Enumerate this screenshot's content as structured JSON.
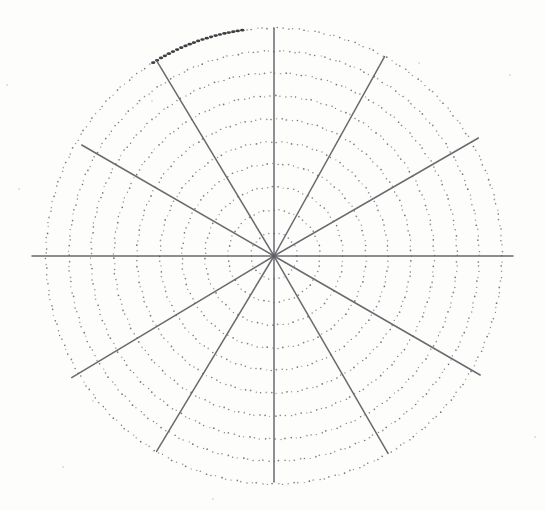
{
  "figure": {
    "name": "polar-coordinate-grid",
    "background_color": "#fdfdfc",
    "width": 546,
    "height": 510
  },
  "chart_data": {
    "type": "scatter",
    "subtype": "polar-grid-template",
    "title": "",
    "subtitle": "",
    "xlabel": "",
    "ylabel": "",
    "grid": true,
    "legend_position": "none",
    "series": [
      {
        "name": "none",
        "values": []
      }
    ],
    "categories": [],
    "x": [],
    "values": [],
    "annotations": [],
    "polar": {
      "center_x": 274,
      "center_y": 256,
      "outer_radius": 228,
      "ring_count": 10,
      "ring_radii": [
        23,
        46,
        69,
        92,
        114,
        137,
        160,
        183,
        205,
        228
      ],
      "ring_style": "dotted",
      "ring_color": "#6b6b72",
      "ring_dot_radius": 0.85,
      "ring_dot_gap_px": 5.2,
      "emphasized_arc": {
        "radius": 228,
        "start_deg": 98,
        "end_deg": 122,
        "color": "#2e2e33",
        "dot_radius": 1.6
      },
      "spoke_count": 12,
      "spoke_color": "#5f5f66",
      "spoke_width": 1.5,
      "spokes": [
        {
          "label": "90",
          "angle_deg": 90,
          "length": 228
        },
        {
          "label": "120",
          "angle_deg": 121,
          "length": 228
        },
        {
          "label": "150",
          "angle_deg": 150,
          "length": 222
        },
        {
          "label": "180",
          "angle_deg": 180,
          "length": 242
        },
        {
          "label": "210",
          "angle_deg": 211,
          "length": 236
        },
        {
          "label": "240",
          "angle_deg": 239,
          "length": 228
        },
        {
          "label": "270",
          "angle_deg": 270,
          "length": 226
        },
        {
          "label": "300",
          "angle_deg": 300,
          "length": 228
        },
        {
          "label": "330",
          "angle_deg": 330,
          "length": 238
        },
        {
          "label": "0",
          "angle_deg": 0,
          "length": 239
        },
        {
          "label": "30",
          "angle_deg": 30,
          "length": 236
        },
        {
          "label": "60",
          "angle_deg": 61,
          "length": 228
        }
      ]
    }
  },
  "scan_artifacts": {
    "specks": [
      {
        "x": 18,
        "y": 188,
        "size": 2
      },
      {
        "x": 62,
        "y": 466,
        "size": 2
      },
      {
        "x": 418,
        "y": 62,
        "size": 2
      },
      {
        "x": 509,
        "y": 74,
        "size": 2
      },
      {
        "x": 151,
        "y": 100,
        "size": 2
      },
      {
        "x": 431,
        "y": 286,
        "size": 2
      },
      {
        "x": 92,
        "y": 400,
        "size": 2
      },
      {
        "x": 212,
        "y": 498,
        "size": 2
      },
      {
        "x": 6,
        "y": 84,
        "size": 2
      },
      {
        "x": 534,
        "y": 436,
        "size": 2
      }
    ]
  }
}
